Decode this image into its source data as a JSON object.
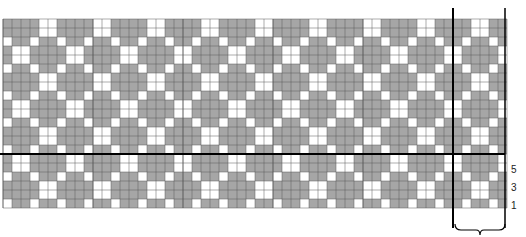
{
  "diagram": {
    "type": "knitting-chart",
    "grid": {
      "columns": 56,
      "rows": 21,
      "cell_px": 9,
      "origin_x": 3,
      "origin_y": 19,
      "pattern_period": 6,
      "rows_below_divider": 6
    },
    "colors": {
      "filled": "#a6a6a6",
      "empty": "#ffffff",
      "gridline": "#5a5a5a",
      "major_line": "#000000"
    },
    "row_labels": [
      "5",
      "3",
      "1"
    ],
    "repeat_bracket": {
      "label": ""
    }
  }
}
